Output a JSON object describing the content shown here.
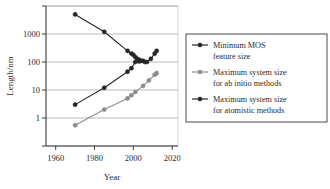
{
  "chart_data": {
    "type": "line",
    "title": "",
    "xlabel": "Year",
    "ylabel": "Length/nm",
    "xlim": [
      1955,
      2023
    ],
    "ylim": [
      0.1,
      10000
    ],
    "yscale": "log",
    "grid": "horizontal",
    "legend_position": "right",
    "xticks": [
      1960,
      1980,
      2000,
      2020
    ],
    "xtick_labels": [
      "1960",
      "1980",
      "2000",
      "2020"
    ],
    "yticks": [
      1,
      10,
      100,
      1000
    ],
    "ytick_labels": [
      "1",
      "10",
      "100",
      "1000"
    ],
    "ygridlines": [
      0.1,
      1,
      10,
      100,
      1000,
      10000
    ],
    "series": [
      {
        "name": "Minimum MOS feature size",
        "color": "#262626",
        "marker": "circle",
        "x": [
          1970,
          1985,
          1997,
          1999,
          2000,
          2001,
          2002,
          2003,
          2004,
          2006
        ],
        "y": [
          5000,
          1200,
          250,
          200,
          180,
          150,
          130,
          120,
          110,
          100
        ]
      },
      {
        "name": "Maximum system size for ab initio methods",
        "color": "#8c8c8c",
        "marker": "circle",
        "x": [
          1970,
          1985,
          1997,
          1999,
          2001,
          2005,
          2008,
          2011,
          2012
        ],
        "y": [
          0.55,
          2.0,
          5.0,
          6.5,
          8.5,
          14,
          22,
          35,
          40
        ]
      },
      {
        "name": "Maximum system size for atomistic methods",
        "color": "#262626",
        "marker": "circle",
        "x": [
          1970,
          1985,
          1997,
          1999,
          2001,
          2003,
          2005,
          2007,
          2009,
          2011,
          2012
        ],
        "y": [
          3.0,
          12,
          45,
          60,
          100,
          105,
          110,
          100,
          130,
          200,
          250
        ]
      }
    ]
  },
  "axes": {
    "ylabel": "Length/nm",
    "xlabel": "Year"
  },
  "legend": {
    "items": [
      {
        "line1": "Minimum MOS",
        "line2": "feature size",
        "color": "#262626"
      },
      {
        "line1": "Maximum system size",
        "line2": "for ab initio methods",
        "color": "#8c8c8c"
      },
      {
        "line1": "Maximum system size",
        "line2": "for atomistic methods",
        "color": "#262626"
      }
    ]
  }
}
